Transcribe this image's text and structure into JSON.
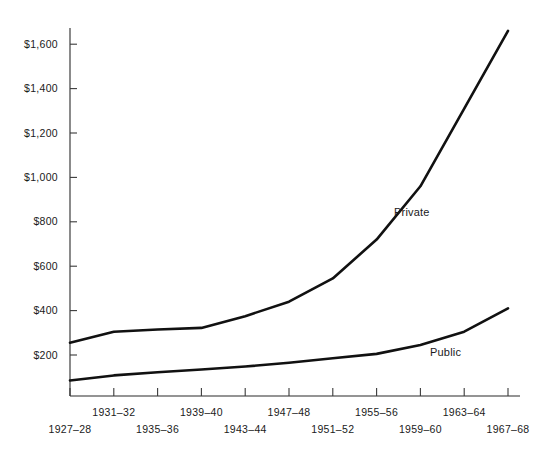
{
  "chart_data": {
    "type": "line",
    "title": "",
    "subtitle": "",
    "xlabel": "",
    "ylabel": "",
    "grid": false,
    "legend_position": "inline-annotations",
    "ylim": [
      0,
      1700
    ],
    "y_ticks": [
      200,
      400,
      600,
      800,
      1000,
      1200,
      1400,
      1600
    ],
    "y_tick_labels": [
      "$200",
      "$400",
      "$600",
      "$800",
      "$1,000",
      "$1,200",
      "$1,400",
      "$1,600"
    ],
    "categories": [
      "1927–28",
      "1931–32",
      "1935–36",
      "1939–40",
      "1943–44",
      "1947–48",
      "1951–52",
      "1955–56",
      "1959–60",
      "1963–64",
      "1967–68"
    ],
    "x_tick_labels_top_row": [
      "1931–32",
      "1939–40",
      "1947–48",
      "1955–56",
      "1963–64"
    ],
    "x_tick_labels_bottom_row": [
      "1927–28",
      "1935–36",
      "1943–44",
      "1951–52",
      "1959–60",
      "1967–68"
    ],
    "series": [
      {
        "name": "Private",
        "label": "Private",
        "color": "#111111",
        "values": [
          255,
          305,
          315,
          322,
          375,
          440,
          545,
          720,
          960,
          1310,
          1660
        ]
      },
      {
        "name": "Public",
        "label": "Public",
        "color": "#111111",
        "values": [
          85,
          108,
          122,
          135,
          148,
          165,
          185,
          205,
          245,
          305,
          410
        ]
      }
    ],
    "annotations": [
      {
        "text": "Private",
        "x_px": 394,
        "y_px": 216
      },
      {
        "text": "Public",
        "x_px": 430,
        "y_px": 356
      }
    ],
    "axis_colors": {
      "axis": "#2b2b2b",
      "line": "#111111",
      "background": "#ffffff",
      "text": "#1a1a1a"
    }
  }
}
